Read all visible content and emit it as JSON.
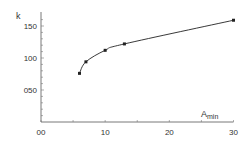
{
  "chart_data": {
    "type": "line",
    "title": "",
    "xlabel": "A_min",
    "ylabel": "k",
    "xlim": [
      0,
      30
    ],
    "ylim": [
      0,
      165
    ],
    "grid": false,
    "legend": null,
    "x_ticks": [
      0,
      5,
      10,
      15,
      20,
      25,
      30
    ],
    "x_tick_labels": [
      "00",
      "",
      "10",
      "",
      "20",
      "",
      "30"
    ],
    "y_ticks": [
      50,
      100,
      150
    ],
    "y_tick_labels": [
      "050",
      "100",
      "150"
    ],
    "y_minor_step": 10,
    "series": [
      {
        "name": "k",
        "x": [
          6,
          7,
          10,
          13,
          30
        ],
        "values": [
          76,
          94,
          112,
          122,
          159
        ],
        "color": "#222222",
        "marker": "square"
      }
    ]
  },
  "labels": {
    "y_axis_title": "k",
    "x_axis_title_main": "A",
    "x_axis_title_sub": "min"
  }
}
